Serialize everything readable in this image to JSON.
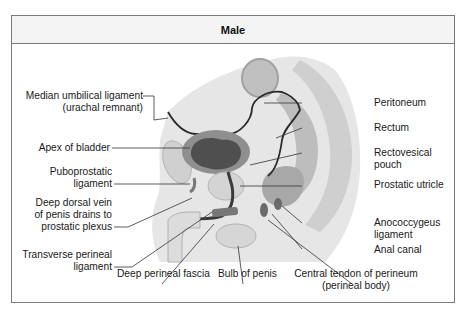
{
  "figure": {
    "title": "Male"
  },
  "labels_left": [
    {
      "line1": "Median umbilical ligament",
      "line2": "(urachal remnant)"
    },
    {
      "line1": "Apex of bladder"
    },
    {
      "line1": "Puboprostatic",
      "line2": "ligament"
    },
    {
      "line1": "Deep dorsal vein",
      "line2": "of penis drains to",
      "line3": "prostatic plexus"
    },
    {
      "line1": "Transverse perineal",
      "line2": "ligament"
    }
  ],
  "labels_right": [
    {
      "line1": "Peritoneum"
    },
    {
      "line1": "Rectum"
    },
    {
      "line1": "Rectovesical",
      "line2": "pouch"
    },
    {
      "line1": "Prostatic utricle"
    },
    {
      "line1": "Anococcygeus",
      "line2": "ligament"
    },
    {
      "line1": "Anal canal"
    }
  ],
  "labels_bottom": [
    {
      "line1": "Deep perineal fascia"
    },
    {
      "line1": "Bulb of penis"
    },
    {
      "line1": "Central tendon of perineum",
      "line2": "(perineal body)"
    }
  ],
  "colors": {
    "border": "#7a7a7a",
    "header_bg": "#f4f4f4",
    "tissue_light": "#d9d9d9",
    "tissue_mid": "#a8a8a8",
    "tissue_dark": "#5e5e5e",
    "line": "#333333"
  }
}
